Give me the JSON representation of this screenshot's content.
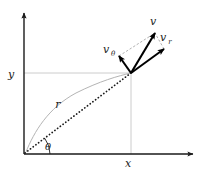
{
  "figure": {
    "type": "vector-diagram",
    "background_color": "#ffffff",
    "width": 204,
    "height": 175
  },
  "colors": {
    "axis": "#1a1a1a",
    "vector": "#000000",
    "gridline": "#c8c8c8",
    "trajectory": "#b0b0b0",
    "radius_dotted": "#1a1a1a",
    "construction": "#a8a8a8",
    "label": "#1a1a1a"
  },
  "axes": {
    "origin": {
      "x": 24,
      "y": 154
    },
    "y_axis": {
      "label": "y",
      "label_pos": {
        "x": 11,
        "y": 78
      },
      "from": {
        "x": 24,
        "y": 154
      },
      "to": {
        "x": 24,
        "y": 13
      }
    },
    "x_axis": {
      "label": "x",
      "label_pos": {
        "x": 128,
        "y": 167
      },
      "from": {
        "x": 24,
        "y": 154
      },
      "to": {
        "x": 193,
        "y": 154
      }
    }
  },
  "gridlines": [
    {
      "name": "horizontal-gridline-y",
      "from": {
        "x": 24,
        "y": 73
      },
      "to": {
        "x": 131,
        "y": 73
      }
    },
    {
      "name": "vertical-gridline-x",
      "from": {
        "x": 131,
        "y": 73
      },
      "to": {
        "x": 131,
        "y": 154
      }
    }
  ],
  "particle": {
    "name": "particle-point",
    "x": 131,
    "y": 73
  },
  "trajectory": {
    "name": "trajectory-curve",
    "description": "light gray curved path through the particle",
    "path": "M 26,152 C 34,132 48,108 76,93 C 100,81 118,76 131,73"
  },
  "radius": {
    "label": "r",
    "label_pos": {
      "x": 58,
      "y": 108
    },
    "style": "dotted",
    "from": {
      "x": 25,
      "y": 153
    },
    "to": {
      "x": 131,
      "y": 73
    }
  },
  "angle": {
    "label": "θ",
    "label_pos": {
      "x": 48,
      "y": 150
    },
    "arc_radius": 26,
    "from_deg": 0,
    "to_deg": 37,
    "vertex": {
      "x": 24,
      "y": 154
    }
  },
  "vectors": [
    {
      "name": "velocity-vector",
      "label": "v",
      "label_pos": {
        "x": 153,
        "y": 25
      },
      "from": {
        "x": 131,
        "y": 73
      },
      "to": {
        "x": 155,
        "y": 33
      },
      "style": "solid-thick"
    },
    {
      "name": "radial-velocity-vector",
      "label": "v",
      "subscript": "r",
      "label_pos": {
        "x": 163,
        "y": 41
      },
      "sub_pos": {
        "x": 170,
        "y": 44
      },
      "from": {
        "x": 131,
        "y": 73
      },
      "to": {
        "x": 164,
        "y": 49
      },
      "style": "solid-thick"
    },
    {
      "name": "tangential-velocity-vector",
      "label": "v",
      "subscript": "θ",
      "label_pos": {
        "x": 106,
        "y": 53
      },
      "sub_pos": {
        "x": 113,
        "y": 56
      },
      "from": {
        "x": 131,
        "y": 73
      },
      "to": {
        "x": 119,
        "y": 56
      },
      "style": "solid-thick"
    }
  ],
  "construction_lines": [
    {
      "name": "parallelogram-edge-upper-left",
      "from": {
        "x": 119,
        "y": 56
      },
      "to": {
        "x": 155,
        "y": 33
      },
      "style": "dashed"
    },
    {
      "name": "parallelogram-edge-upper-right",
      "from": {
        "x": 164,
        "y": 49
      },
      "to": {
        "x": 155,
        "y": 33
      },
      "style": "dashed"
    }
  ]
}
